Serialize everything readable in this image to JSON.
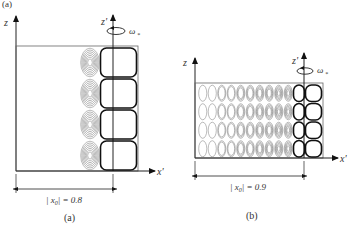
{
  "figure": {
    "header_label": "(a)",
    "panels": [
      {
        "id": "a",
        "caption": "(a)",
        "axis_z": "z",
        "axis_zprime": "z'",
        "axis_xprime": "x'",
        "rotation_label": "ω",
        "rotation_subscript": "*",
        "dimension_label": "| x",
        "dimension_subscript": "0",
        "dimension_value": "| = 0.8",
        "x0": 0.8,
        "rows": 4,
        "weak_columns": 1
      },
      {
        "id": "b",
        "caption": "(b)",
        "axis_z": "z",
        "axis_zprime": "z'",
        "axis_xprime": "x'",
        "rotation_label": "ω",
        "rotation_subscript": "*",
        "dimension_label": "| x",
        "dimension_subscript": "0",
        "dimension_value": "| = 0.9",
        "x0": 0.9,
        "rows": 4,
        "weak_columns": 10
      }
    ]
  }
}
